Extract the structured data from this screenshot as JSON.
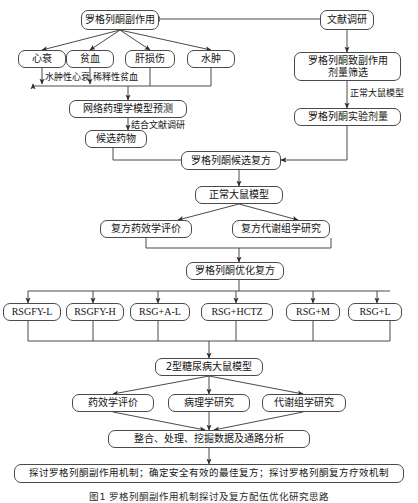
{
  "figure": {
    "caption": "图1  罗格列酮副作用机制探讨及复方配伍优化研究思路"
  },
  "nodes": {
    "rsg_side_effects": "罗格列酮副作用",
    "literature_review": "文献调研",
    "heart_failure": "心衰",
    "anemia": "贫血",
    "liver_injury": "肝损伤",
    "edema": "水肿",
    "dose_screening": "罗格列酮致副作用\n剂量筛选",
    "experimental_dose": "罗格列酮实验剂量",
    "network_pharmacology": "网络药理学模型预测",
    "candidate_drugs": "候选药物",
    "candidate_formula": "罗格列酮候选复方",
    "normal_rat_model": "正常大鼠模型",
    "formula_efficacy": "复方药效学评价",
    "formula_metabolomics": "复方代谢组学研究",
    "optimized_formula": "罗格列酮优化复方",
    "groups": [
      "RSGFY-L",
      "RSGFY-H",
      "RSG+A-L",
      "RSG+HCTZ",
      "RSG+M",
      "RSG+L"
    ],
    "t2dm_model": "2型糖尿病大鼠模型",
    "efficacy_eval": "药效学评价",
    "pathology_study": "病理学研究",
    "metabolomics_study": "代谢组学研究",
    "data_integration": "整合、处理、挖掘数据及通路分析",
    "conclusion": "探讨罗格列酮副作用机制；确定安全有效的最佳复方；探讨罗格列酮复方疗效机制"
  },
  "edge_labels": {
    "edematous_heart_failure": "水肿性心衰",
    "dilutional_anemia": "稀释性贫血",
    "combined_literature": "结合文献调研",
    "normal_rat_model_label": "正常大鼠模型"
  },
  "colors": {
    "stroke": "#4a4a4a",
    "text": "#141414",
    "background": "#ffffff"
  }
}
